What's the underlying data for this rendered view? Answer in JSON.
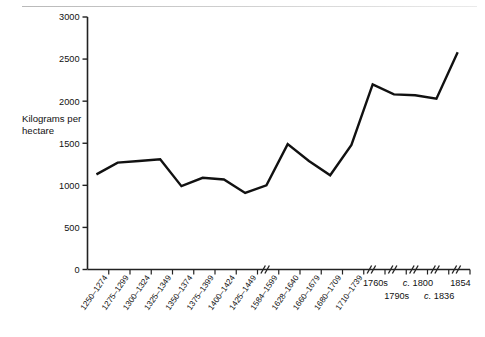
{
  "figure": {
    "axis_title": "Kilograms per hectare",
    "axis_title_line1": "Kilograms per",
    "axis_title_line2": "hectare"
  },
  "yaxis": {
    "ticks": [
      "0",
      "500",
      "1000",
      "1500",
      "2000",
      "2500",
      "3000"
    ],
    "min": 0,
    "max": 3000
  },
  "xaxis": {
    "rotated_labels": [
      "1250–1274",
      "1275–1299",
      "1300–1324",
      "1325–1349",
      "1350–1374",
      "1375–1399",
      "1400–1424",
      "1425–1449",
      "1584–1599",
      "1628–1640",
      "1660–1679",
      "1680–1709",
      "1710–1739"
    ],
    "flat_labels": [
      {
        "text": "1760s",
        "italic_prefix": ""
      },
      {
        "text": "1790s",
        "italic_prefix": ""
      },
      {
        "text": "1800",
        "italic_prefix": "c."
      },
      {
        "text": "1836",
        "italic_prefix": "c."
      },
      {
        "text": "1854",
        "italic_prefix": ""
      }
    ]
  },
  "chart_data": {
    "type": "line",
    "title": "",
    "xlabel": "",
    "ylabel": "Kilograms per hectare",
    "ylim": [
      0,
      3000
    ],
    "grid": false,
    "legend": "none",
    "categories": [
      "1250–1274",
      "1275–1299",
      "1300–1324",
      "1325–1349",
      "1350–1374",
      "1375–1399",
      "1400–1424",
      "1425–1449",
      "1584–1599",
      "1628–1640",
      "1660–1679",
      "1680–1709",
      "1710–1739",
      "1760s",
      "1790s",
      "c. 1800",
      "c. 1836",
      "1854"
    ],
    "values": [
      1130,
      1270,
      1290,
      1310,
      990,
      1090,
      1070,
      910,
      1000,
      1490,
      1290,
      1120,
      1480,
      2200,
      2080,
      2070,
      2030,
      2580
    ],
    "axis_breaks_after": [
      "1425–1449",
      "1710–1739",
      "1760s",
      "1790s",
      "c. 1800",
      "c. 1836"
    ]
  },
  "style": {
    "line_color": "#111111",
    "axis_color": "#222222",
    "background": "#ffffff"
  }
}
